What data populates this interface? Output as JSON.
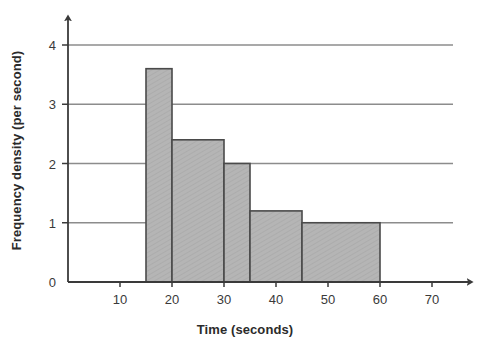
{
  "chart_data": {
    "type": "bar",
    "title": "",
    "subtitle": "",
    "xlabel": "Time (seconds)",
    "ylabel": "Frequency density (per second)",
    "xlim": [
      0,
      75
    ],
    "ylim": [
      0,
      4.4
    ],
    "x_ticks": [
      10,
      20,
      30,
      40,
      50,
      60,
      70
    ],
    "x_tick_labels": [
      "10",
      "20",
      "30",
      "40",
      "50",
      "60",
      "70"
    ],
    "y_ticks": [
      0,
      1,
      2,
      3,
      4
    ],
    "y_tick_labels": [
      "0",
      "1",
      "2",
      "3",
      "4"
    ],
    "grid": "horizontal",
    "gridlines_at": [
      1,
      2,
      3,
      4
    ],
    "legend": null,
    "bars": [
      {
        "label": "15-20",
        "x_start": 15,
        "x_end": 20,
        "value": 3.6
      },
      {
        "label": "20-30",
        "x_start": 20,
        "x_end": 30,
        "value": 2.4
      },
      {
        "label": "30-35",
        "x_start": 30,
        "x_end": 35,
        "value": 2.0
      },
      {
        "label": "35-45",
        "x_start": 35,
        "x_end": 45,
        "value": 1.2
      },
      {
        "label": "45-60",
        "x_start": 45,
        "x_end": 60,
        "value": 1.0
      }
    ],
    "categories": [
      "15-20",
      "20-30",
      "30-35",
      "35-45",
      "45-60"
    ],
    "values": [
      3.6,
      2.4,
      2.0,
      1.2,
      1.0
    ],
    "colors": {
      "bar_fill": "#b3b3b3",
      "bar_edge": "#4a4a4a",
      "axis": "#3a3a3a",
      "gridline": "#8c8c8c",
      "text": "#2b2b2b",
      "background": "#ffffff"
    }
  }
}
